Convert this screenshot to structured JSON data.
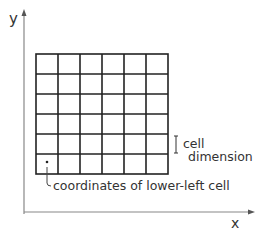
{
  "diagram": {
    "axes": {
      "x_label": "x",
      "y_label": "y"
    },
    "grid": {
      "columns": 6,
      "rows": 6
    },
    "annotations": {
      "cell_dimension_line1": "cell",
      "cell_dimension_line2": "dimension",
      "lower_left": "coordinates of lower-left cell"
    }
  }
}
